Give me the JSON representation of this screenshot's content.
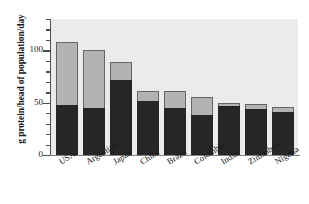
{
  "chart_data": {
    "type": "bar",
    "subtype": "stacked-bar",
    "title": "",
    "xlabel": "",
    "ylabel": "g protein/head of population/day",
    "categories": [
      "USA",
      "Argentina",
      "Japan",
      "China",
      "Brazil",
      "Colombia",
      "India",
      "Zimbabwe",
      "Nigeria"
    ],
    "series": [
      {
        "name": "animal protein",
        "color": "#262626",
        "values": [
          48,
          45,
          72,
          52,
          45,
          38,
          47,
          44,
          41
        ]
      },
      {
        "name": "other protein",
        "color": "#b3b3b3",
        "values": [
          60,
          55,
          17,
          9,
          16,
          17,
          3,
          5,
          5
        ]
      }
    ],
    "totals": [
      108,
      100,
      89,
      61,
      61,
      55,
      50,
      49,
      46
    ],
    "ylim": [
      0,
      130
    ],
    "yticks_major": [
      0,
      50,
      100
    ],
    "yticks_minor": [
      10,
      20,
      30,
      40,
      60,
      70,
      80,
      90,
      110,
      120,
      130
    ],
    "ytick_labels": [
      "0",
      "50",
      "100"
    ],
    "grid": false,
    "legend": "none",
    "plot_background": "#ebebeb"
  },
  "axis": {
    "y_title": "g protein/head of population/day",
    "tick_0": "0",
    "tick_50": "50",
    "tick_100": "100"
  }
}
